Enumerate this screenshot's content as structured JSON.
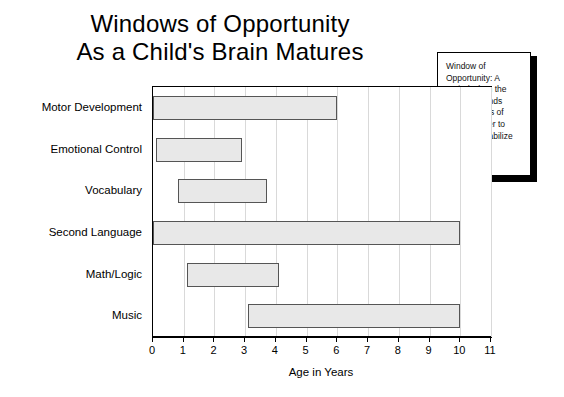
{
  "title": {
    "line1": "Windows of Opportunity",
    "line2": "As a Child's Brain Matures"
  },
  "callout": {
    "name": "window-of-opportunity-definition",
    "text": "Window of Opportunity: A period when the brain demands certain types of input in order to create or stabilize long-lasting structures."
  },
  "axis": {
    "xlabel": "Age in Years",
    "ticks": [
      "0",
      "1",
      "2",
      "3",
      "4",
      "5",
      "6",
      "7",
      "8",
      "9",
      "10",
      "11"
    ]
  },
  "chart_data": {
    "type": "bar",
    "orientation": "horizontal",
    "subtype": "floating-range-bar",
    "title": "Windows of Opportunity As a Child's Brain Matures",
    "xlabel": "Age in Years",
    "ylabel": "",
    "xlim": [
      0,
      11
    ],
    "xticks": [
      0,
      1,
      2,
      3,
      4,
      5,
      6,
      7,
      8,
      9,
      10,
      11
    ],
    "grid": true,
    "legend": false,
    "categories": [
      "Motor Development",
      "Emotional Control",
      "Vocabulary",
      "Second Language",
      "Math/Logic",
      "Music"
    ],
    "bars": [
      {
        "category": "Motor Development",
        "start": 0,
        "end": 6,
        "length": 6
      },
      {
        "category": "Emotional Control",
        "start": 0.1,
        "end": 2.9,
        "length": 2.8
      },
      {
        "category": "Vocabulary",
        "start": 0.8,
        "end": 3.7,
        "length": 2.9
      },
      {
        "category": "Second Language",
        "start": 0,
        "end": 10,
        "length": 10
      },
      {
        "category": "Math/Logic",
        "start": 1.1,
        "end": 4.1,
        "length": 3.0
      },
      {
        "category": "Music",
        "start": 3.1,
        "end": 10,
        "length": 6.9
      }
    ],
    "annotations": [
      "Window of Opportunity: A period when the brain demands certain types of input in order to create or stabilize long-lasting structures."
    ],
    "colors": {
      "bar_fill": "#e8e8e8",
      "bar_edge": "#555555",
      "grid": "#d9d9d9",
      "axis": "#000000",
      "background": "#ffffff"
    }
  }
}
